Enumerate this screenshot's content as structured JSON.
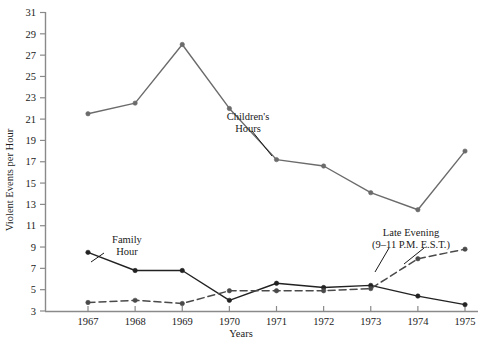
{
  "chart_data": {
    "type": "line",
    "title": "",
    "xlabel": "Years",
    "ylabel": "Violent Events per Hour",
    "categories": [
      "1967",
      "1968",
      "1969",
      "1970",
      "1971",
      "1972",
      "1973",
      "1974",
      "1975"
    ],
    "x": [
      1967,
      1968,
      1969,
      1970,
      1971,
      1972,
      1973,
      1974,
      1975
    ],
    "xlim": [
      1966.6,
      1975.4
    ],
    "ylim": [
      3,
      31
    ],
    "yticks": [
      3,
      5,
      7,
      9,
      11,
      13,
      15,
      17,
      19,
      21,
      23,
      25,
      27,
      29,
      31
    ],
    "xticks": [
      "1967",
      "1968",
      "1969",
      "1970",
      "1971",
      "1972",
      "1973",
      "1974",
      "1975"
    ],
    "grid": false,
    "legend": "inline-annotations",
    "series": [
      {
        "name": "Children's Hours",
        "style": "solid",
        "color": "#6b6b6b",
        "marker": "circle",
        "values": [
          21.5,
          22.5,
          28.0,
          22.0,
          17.2,
          16.6,
          14.1,
          12.5,
          18.0
        ]
      },
      {
        "name": "Family Hour",
        "style": "solid",
        "color": "#222222",
        "marker": "circle",
        "values": [
          8.5,
          6.8,
          6.8,
          4.0,
          5.6,
          5.2,
          5.4,
          4.4,
          3.6
        ]
      },
      {
        "name": "Late Evening (9-11 P.M. E.S.T.)",
        "style": "dashed",
        "color": "#4a4a4a",
        "marker": "circle",
        "values": [
          3.8,
          4.0,
          3.7,
          4.9,
          4.9,
          4.9,
          5.1,
          7.9,
          8.8
        ]
      }
    ],
    "annotations": [
      {
        "id": "childrens-hours",
        "line1": "Children's",
        "line2": "Hours"
      },
      {
        "id": "family-hour",
        "line1": "Family",
        "line2": "Hour"
      },
      {
        "id": "late-evening",
        "line1": "Late Evening",
        "line2": "(9–11 P.M. E.S.T.)"
      }
    ]
  },
  "ticks": {
    "y": [
      "31",
      "29",
      "27",
      "25",
      "23",
      "21",
      "19",
      "17",
      "15",
      "13",
      "11",
      "9",
      "7",
      "5",
      "3"
    ],
    "x": [
      "1967",
      "1968",
      "1969",
      "1970",
      "1971",
      "1972",
      "1973",
      "1974",
      "1975"
    ]
  },
  "labels": {
    "y_axis_title": "Violent Events per Hour",
    "x_axis_title": "Years",
    "childrens_hours_l1": "Children's",
    "childrens_hours_l2": "Hours",
    "family_hour_l1": "Family",
    "family_hour_l2": "Hour",
    "late_evening_l1": "Late Evening",
    "late_evening_l2": "(9–11 P.M. E.S.T.)"
  },
  "colors": {
    "childrens": "#6b6b6b",
    "family": "#222222",
    "late_evening": "#4a4a4a",
    "axis": "#8a8a8a",
    "text": "#1a1a1a"
  }
}
